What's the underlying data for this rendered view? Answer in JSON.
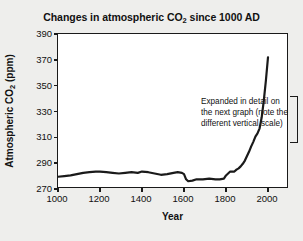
{
  "figure": {
    "background_color": "#eeeeec",
    "plot_background_color": "#ffffff",
    "axis_color": "#1a1a1a",
    "line_color": "#1a1a1a"
  },
  "title_parts": {
    "before": "Changes in atmospheric CO",
    "subscript": "2",
    "after": " since 1000 AD"
  },
  "ylabel_parts": {
    "before": "Atmospheric CO",
    "subscript": "2",
    "after": " (ppm)"
  },
  "annotation": {
    "text": "Expanded in detail on the next graph (note the different vertical scale)",
    "bracket": "right-square-bracket"
  },
  "chart_data": {
    "type": "line",
    "title": "Changes in atmospheric CO2 since 1000 AD",
    "xlabel": "Year",
    "ylabel": "Atmospheric CO2 (ppm)",
    "xlim": [
      1000,
      2100
    ],
    "ylim": [
      270,
      390
    ],
    "xticks": [
      1000,
      1200,
      1400,
      1600,
      1800,
      2000
    ],
    "yticks": [
      270,
      290,
      310,
      330,
      350,
      370,
      390
    ],
    "xtick_labels": [
      "1000",
      "1200",
      "1400",
      "1600",
      "1800",
      "2000"
    ],
    "ytick_labels": [
      "270",
      "290",
      "310",
      "330",
      "350",
      "370",
      "390"
    ],
    "grid": false,
    "legend": false,
    "annotations": [
      {
        "text": "Expanded in detail on the next graph (note the different vertical scale)",
        "x": 1650,
        "y": 352
      }
    ],
    "series": [
      {
        "name": "Atmospheric CO2",
        "x": [
          1000,
          1030,
          1060,
          1090,
          1120,
          1150,
          1180,
          1200,
          1230,
          1260,
          1290,
          1320,
          1350,
          1380,
          1400,
          1430,
          1460,
          1490,
          1520,
          1550,
          1570,
          1590,
          1600,
          1610,
          1620,
          1640,
          1660,
          1690,
          1720,
          1750,
          1770,
          1790,
          1800,
          1820,
          1840,
          1850,
          1860,
          1870,
          1880,
          1890,
          1900,
          1910,
          1920,
          1930,
          1940,
          1950,
          1960,
          1970,
          1980,
          1990,
          2000
        ],
        "y": [
          279.5,
          280.0,
          280.5,
          281.5,
          282.5,
          283.0,
          283.5,
          283.5,
          283.0,
          282.5,
          282.0,
          282.5,
          283.0,
          282.5,
          283.5,
          283.0,
          282.0,
          281.0,
          281.5,
          282.5,
          283.0,
          282.5,
          281.5,
          277.5,
          276.0,
          276.5,
          277.5,
          277.5,
          278.0,
          277.5,
          277.5,
          278.0,
          280.5,
          283.5,
          283.5,
          285.0,
          286.0,
          287.5,
          289.5,
          292.0,
          295.5,
          299.0,
          303.0,
          306.5,
          310.5,
          313.0,
          317.0,
          325.5,
          338.5,
          354.0,
          372.0
        ]
      }
    ]
  }
}
